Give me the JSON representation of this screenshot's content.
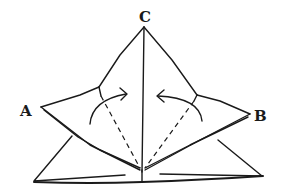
{
  "figure": {
    "type": "origami-fold-diagram",
    "labels": {
      "a": "A",
      "b": "B",
      "c": "C"
    },
    "instructions": {
      "left_arrow": "fold left flap toward center",
      "right_arrow": "fold right flap toward center"
    },
    "colors": {
      "ink": "#1a1a1a",
      "background": "#ffffff"
    }
  }
}
